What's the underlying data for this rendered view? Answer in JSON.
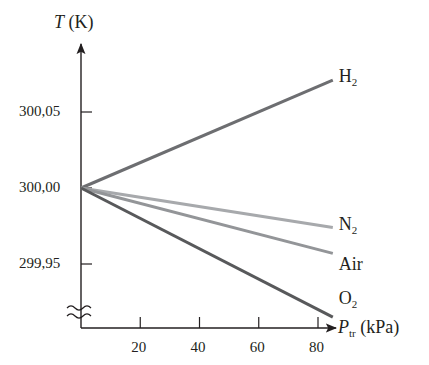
{
  "chart_data": {
    "type": "line",
    "title": "",
    "xlabel": "P_tr (kPa)",
    "xlabel_parts": {
      "symbol": "P",
      "subscript": "tr",
      "unit": "(kPa)"
    },
    "ylabel": "T (K)",
    "ylabel_parts": {
      "symbol": "T",
      "unit": "(K)"
    },
    "xlim": [
      0,
      85
    ],
    "ylim": [
      299.9,
      300.08
    ],
    "x_ticks": [
      20,
      40,
      60,
      80
    ],
    "x_tick_labels": [
      "20",
      "40",
      "60",
      "80"
    ],
    "y_ticks": [
      299.95,
      300.0,
      300.05
    ],
    "y_tick_labels": [
      "299,95",
      "300,00",
      "300,05"
    ],
    "y_axis_break": true,
    "grid": false,
    "legend_position": "inline labels at line ends (right)",
    "series": [
      {
        "name": "H2",
        "label_main": "H",
        "label_sub": "2",
        "color": "#6d6e71",
        "x": [
          0,
          85
        ],
        "y": [
          300.0,
          300.071
        ]
      },
      {
        "name": "N2",
        "label_main": "N",
        "label_sub": "2",
        "color": "#a7a9ac",
        "x": [
          0,
          85
        ],
        "y": [
          300.0,
          299.974
        ]
      },
      {
        "name": "Air",
        "label_main": "Air",
        "label_sub": "",
        "color": "#939598",
        "x": [
          0,
          85
        ],
        "y": [
          300.0,
          299.957
        ]
      },
      {
        "name": "O2",
        "label_main": "O",
        "label_sub": "2",
        "color": "#58595b",
        "x": [
          0,
          85
        ],
        "y": [
          300.0,
          299.915
        ]
      }
    ]
  },
  "axis_color": "#231f20"
}
